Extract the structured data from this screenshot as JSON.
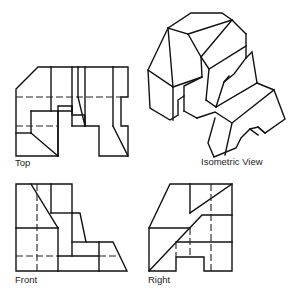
{
  "figure": {
    "views": {
      "top": {
        "label": "Top"
      },
      "isometric": {
        "label": "Isometric View"
      },
      "front": {
        "label": "Front"
      },
      "right": {
        "label": "Right"
      }
    },
    "line_color": "#111111",
    "background": "#ffffff"
  }
}
